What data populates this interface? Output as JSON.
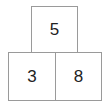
{
  "diagram": {
    "type": "number-pyramid",
    "top": {
      "value": "5"
    },
    "bottom": [
      {
        "value": "3"
      },
      {
        "value": "8"
      }
    ]
  }
}
